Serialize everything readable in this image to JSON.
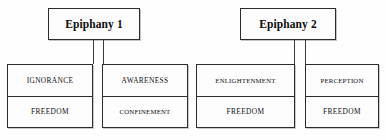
{
  "diagram": {
    "background_color": "#fefefe",
    "line_color": "#2b2b2b",
    "nodes": [
      {
        "id": "epiphany-1",
        "label": "Epiphany 1"
      },
      {
        "id": "epiphany-2",
        "label": "Epiphany 2"
      }
    ],
    "leaves": [
      {
        "id": "leaf-1",
        "parent": "epiphany-1",
        "top": "IGNORANCE",
        "bottom": "FREEDOM"
      },
      {
        "id": "leaf-2",
        "parent": "epiphany-1",
        "top": "AWARENESS",
        "bottom": "CONFINEMENT"
      },
      {
        "id": "leaf-3",
        "parent": "epiphany-2",
        "top": "ENLIGHTENMENT",
        "bottom": "FREEDOM"
      },
      {
        "id": "leaf-4",
        "parent": "epiphany-2",
        "top": "PERCEPTION",
        "bottom": "FREEDOM"
      }
    ]
  }
}
